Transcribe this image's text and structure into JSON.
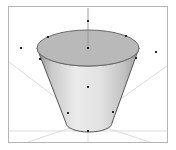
{
  "viewport": {
    "width": 176,
    "height": 150,
    "background_color": "#ffffff",
    "label": "3D cone perspective viewport"
  },
  "frame": {
    "label": "viewport border frame",
    "x": 8,
    "y": 6,
    "width": 160,
    "height": 137,
    "stroke_color": "#b5b5b5",
    "stroke_width": 1,
    "fill_color": "#ffffff"
  },
  "guides": {
    "label": "perspective guide lines",
    "stroke_color": "#dcdcdc",
    "stroke_width": 1,
    "vanishing_point": {
      "x": 88,
      "y": 122
    },
    "lines": [
      {
        "name": "guide-upper-left",
        "x1": 88,
        "y1": 122,
        "x2": 9,
        "y2": 62
      },
      {
        "name": "guide-upper-right",
        "x1": 88,
        "y1": 122,
        "x2": 167,
        "y2": 66
      },
      {
        "name": "guide-lower-left",
        "x1": 88,
        "y1": 122,
        "x2": 28,
        "y2": 142
      },
      {
        "name": "guide-lower-right",
        "x1": 88,
        "y1": 122,
        "x2": 150,
        "y2": 142
      },
      {
        "name": "guide-ground-line",
        "x1": 9,
        "y1": 131,
        "x2": 167,
        "y2": 131
      },
      {
        "name": "guide-vertical-below",
        "x1": 88,
        "y1": 122,
        "x2": 88,
        "y2": 142
      }
    ]
  },
  "axis": {
    "label": "vertical rotation axis",
    "stroke_color": "#9a9a9a",
    "stroke_width": 1,
    "x1": 88,
    "y1": 8,
    "x2": 88,
    "y2": 48
  },
  "cone": {
    "label": "truncated cone frustum solid",
    "top_ellipse": {
      "name": "cone-top-face",
      "cx": 88,
      "cy": 48,
      "rx": 51,
      "ry": 18,
      "fill_color": "#b9b9b9",
      "stroke_color": "#6a6a6a",
      "stroke_width": 1
    },
    "body": {
      "name": "cone-side-surface",
      "top_left_x": 37,
      "top_y": 48,
      "top_right_x": 139,
      "bottom_left_x": 66,
      "bottom_y": 123,
      "bottom_right_x": 112,
      "bottom_ry": 9,
      "stroke_color": "#555555",
      "stroke_width": 1,
      "gradient_stops": [
        {
          "offset": "0%",
          "color": "#8f8f8f"
        },
        {
          "offset": "14%",
          "color": "#c9c9c9"
        },
        {
          "offset": "38%",
          "color": "#ebebeb"
        },
        {
          "offset": "62%",
          "color": "#e2e2e2"
        },
        {
          "offset": "85%",
          "color": "#c2c2c2"
        },
        {
          "offset": "100%",
          "color": "#9c9c9c"
        }
      ]
    }
  },
  "markers": {
    "label": "control point markers",
    "color": "#262626",
    "size": 2,
    "points": [
      {
        "name": "marker-axis-top",
        "x": 88,
        "y": 21
      },
      {
        "name": "marker-top-center",
        "x": 88,
        "y": 48
      },
      {
        "name": "marker-top-rim-left",
        "x": 48,
        "y": 37
      },
      {
        "name": "marker-top-rim-right",
        "x": 126,
        "y": 36
      },
      {
        "name": "marker-top-rim-lleft",
        "x": 40,
        "y": 59
      },
      {
        "name": "marker-top-rim-rright",
        "x": 136,
        "y": 58
      },
      {
        "name": "marker-body-center",
        "x": 88,
        "y": 87
      },
      {
        "name": "marker-base-left",
        "x": 68,
        "y": 113
      },
      {
        "name": "marker-base-right",
        "x": 113,
        "y": 112
      },
      {
        "name": "marker-base-bottom",
        "x": 88,
        "y": 131
      },
      {
        "name": "marker-free-left",
        "x": 21,
        "y": 48
      },
      {
        "name": "marker-free-right",
        "x": 156,
        "y": 52
      }
    ]
  }
}
